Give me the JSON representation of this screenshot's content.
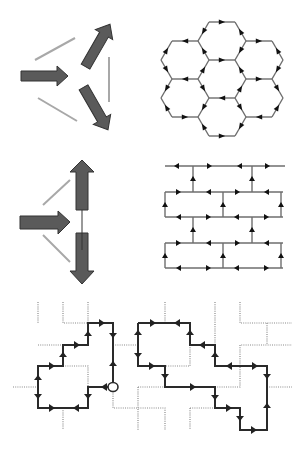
{
  "figure": {
    "panels": [
      {
        "id": "a",
        "label": "three-arrow vertex (triangular)",
        "position": "top-left"
      },
      {
        "id": "b",
        "label": "hexagonal lattice with directed edges",
        "position": "top-right"
      },
      {
        "id": "c",
        "label": "split-vertex arrows (brick)",
        "position": "middle-left"
      },
      {
        "id": "d",
        "label": "brick-wall lattice with directed edges",
        "position": "middle-right"
      },
      {
        "id": "e",
        "label": "loop configuration on square grid",
        "position": "bottom"
      }
    ],
    "colors": {
      "fat_arrow_fill": "#5a5a5a",
      "gray_line": "#a8a8a8",
      "lattice_line": "#6e6e6e",
      "loop_line": "#2a2a2a",
      "dotted_line": "#8a8a8a",
      "arrowhead": "#111111"
    },
    "hex_lattice": {
      "hex_count": 7,
      "centers": [
        [
          222,
          41
        ],
        [
          185,
          60
        ],
        [
          259,
          60
        ],
        [
          222,
          79
        ],
        [
          185,
          98
        ],
        [
          259,
          98
        ],
        [
          222,
          117
        ]
      ]
    },
    "brick_lattice": {
      "rows_y": [
        166,
        192,
        217,
        243,
        268
      ],
      "x_left": 165,
      "x_right": 283
    },
    "loop_grid": {
      "columns_x": [
        38,
        63,
        88,
        113,
        138,
        165,
        190,
        215,
        240,
        267,
        292
      ],
      "rows_y": [
        323,
        345,
        366,
        387,
        408,
        430
      ],
      "marker": "circle-start-point"
    }
  }
}
